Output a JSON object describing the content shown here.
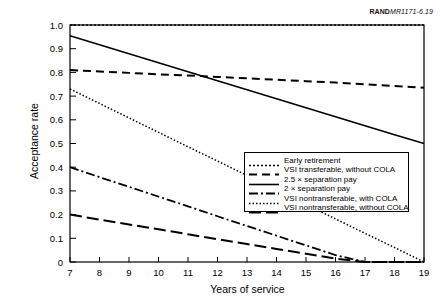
{
  "source_tag": {
    "brand": "RAND",
    "reference": "MR1171-6.19"
  },
  "chart_data": {
    "type": "line",
    "title": "",
    "xlabel": "Years of service",
    "ylabel": "Acceptance rate",
    "xlim": [
      7,
      19
    ],
    "ylim": [
      0,
      1.0
    ],
    "grid": false,
    "legend_position": "bottom-right",
    "xticks": [
      7,
      8,
      9,
      10,
      11,
      12,
      13,
      14,
      15,
      16,
      17,
      18,
      19
    ],
    "xtick_labels": [
      "7",
      "8",
      "9",
      "10",
      "11",
      "12",
      "13",
      "14",
      "15",
      "16",
      "17",
      "18",
      "19"
    ],
    "yticks": [
      0,
      0.1,
      0.2,
      0.3,
      0.4,
      0.5,
      0.6,
      0.7,
      0.8,
      0.9,
      1.0
    ],
    "ytick_labels": [
      "0",
      "0.1",
      "0.2",
      "0.3",
      "0.4",
      "0.5",
      "0.6",
      "0.7",
      "0.8",
      "0.9",
      "1.0"
    ],
    "x": [
      7,
      8,
      9,
      10,
      11,
      12,
      13,
      14,
      15,
      16,
      17,
      18,
      19
    ],
    "series": [
      {
        "name": "Early retirement",
        "style": "dotted",
        "color": "#000000",
        "width": 1.6,
        "dasharray": "2,2",
        "values": [
          1.0,
          1.0,
          1.0,
          1.0,
          1.0,
          1.0,
          1.0,
          1.0,
          1.0,
          1.0,
          1.0,
          1.0,
          1.0
        ]
      },
      {
        "name": "VSI transferable, without COLA",
        "style": "dashed",
        "color": "#000000",
        "width": 2.0,
        "dasharray": "8,5",
        "values": [
          0.81,
          0.804,
          0.798,
          0.792,
          0.787,
          0.781,
          0.775,
          0.769,
          0.763,
          0.757,
          0.75,
          0.743,
          0.735
        ]
      },
      {
        "name": "2.5 × separation pay",
        "style": "solid",
        "color": "#000000",
        "width": 1.6,
        "dasharray": "none",
        "values": [
          0.955,
          0.917,
          0.879,
          0.841,
          0.803,
          0.765,
          0.727,
          0.689,
          0.651,
          0.613,
          0.575,
          0.537,
          0.5
        ]
      },
      {
        "name": "2 × separation pay",
        "style": "dash-dot",
        "color": "#000000",
        "width": 1.8,
        "dasharray": "9,3,2,3",
        "values": [
          0.4,
          0.358,
          0.317,
          0.276,
          0.235,
          0.193,
          0.152,
          0.111,
          0.07,
          0.029,
          0,
          0,
          0
        ]
      },
      {
        "name": "VSI nontransferable, with COLA",
        "style": "dotted",
        "color": "#000000",
        "width": 1.5,
        "dasharray": "1.5,2",
        "values": [
          0.73,
          0.669,
          0.608,
          0.547,
          0.486,
          0.426,
          0.365,
          0.304,
          0.243,
          0.182,
          0.121,
          0.061,
          0
        ]
      },
      {
        "name": "VSI nontransferable, without COLA",
        "style": "long-dash",
        "color": "#000000",
        "width": 2.0,
        "dasharray": "12,5",
        "values": [
          0.2,
          0.179,
          0.158,
          0.138,
          0.117,
          0.096,
          0.076,
          0.055,
          0.035,
          0.014,
          0,
          0,
          0
        ]
      }
    ]
  }
}
